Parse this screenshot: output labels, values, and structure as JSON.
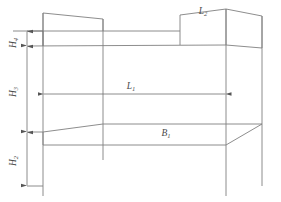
{
  "figure": {
    "type": "engineering-dimension-diagram",
    "background_color": "#ffffff",
    "line_color": "#808080",
    "label_color": "#4a4a4a"
  },
  "labels": {
    "H4": {
      "base": "H",
      "sub": "4",
      "text": "H4",
      "orientation": "vertical",
      "x": 16,
      "y": 40
    },
    "H3": {
      "base": "H",
      "sub": "3",
      "text": "H3",
      "orientation": "vertical",
      "x": 16,
      "y": 92
    },
    "H2": {
      "base": "H",
      "sub": "2",
      "text": "H2",
      "orientation": "vertical",
      "x": 16,
      "y": 159
    },
    "L1": {
      "base": "L",
      "sub": "1",
      "text": "L1",
      "orientation": "horizontal",
      "x": 131,
      "y": 88
    },
    "L2": {
      "base": "L",
      "sub": "2",
      "text": "L2",
      "orientation": "horizontal",
      "x": 203,
      "y": 13
    },
    "B1": {
      "base": "B",
      "sub": "1",
      "text": "B1",
      "orientation": "horizontal",
      "x": 166,
      "y": 134
    }
  },
  "dimensions": [
    {
      "name": "H4",
      "kind": "vertical",
      "from_y": 31,
      "to_y": 46,
      "axis_x": 27
    },
    {
      "name": "H3",
      "kind": "vertical",
      "from_y": 46,
      "to_y": 132,
      "axis_x": 27
    },
    {
      "name": "H2",
      "kind": "vertical",
      "from_y": 132,
      "to_y": 186,
      "axis_x": 27
    },
    {
      "name": "L1",
      "kind": "horizontal",
      "from_x": 43,
      "to_x": 226,
      "axis_y": 94
    }
  ],
  "geometry": {
    "upper_deck_top_y": 31,
    "upper_deck_bottom_y": 46,
    "base_plate_y": 132,
    "ground_y": 186,
    "left_post_x": 43,
    "right_post_x": 226
  }
}
